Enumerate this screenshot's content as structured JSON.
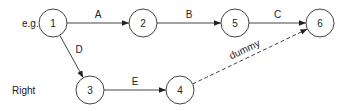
{
  "diagram": {
    "type": "activity-network",
    "row_labels": [
      {
        "id": "eg",
        "text": "e.g.",
        "x": 22,
        "y": 27
      },
      {
        "id": "right",
        "text": "Right",
        "x": 12,
        "y": 94
      }
    ],
    "nodes": [
      {
        "id": "1",
        "label": "1",
        "cx": 53,
        "cy": 23,
        "r": 14
      },
      {
        "id": "2",
        "label": "2",
        "cx": 143,
        "cy": 23,
        "r": 14
      },
      {
        "id": "5",
        "label": "5",
        "cx": 235,
        "cy": 23,
        "r": 14
      },
      {
        "id": "6",
        "label": "6",
        "cx": 320,
        "cy": 23,
        "r": 14
      },
      {
        "id": "3",
        "label": "3",
        "cx": 90,
        "cy": 90,
        "r": 14
      },
      {
        "id": "4",
        "label": "4",
        "cx": 180,
        "cy": 90,
        "r": 14
      }
    ],
    "edges": [
      {
        "id": "A",
        "label": "A",
        "from": "1",
        "to": "2",
        "dashed": false
      },
      {
        "id": "B",
        "label": "B",
        "from": "2",
        "to": "5",
        "dashed": false
      },
      {
        "id": "C",
        "label": "C",
        "from": "5",
        "to": "6",
        "dashed": false
      },
      {
        "id": "D",
        "label": "D",
        "from": "1",
        "to": "3",
        "dashed": false
      },
      {
        "id": "E",
        "label": "E",
        "from": "3",
        "to": "4",
        "dashed": false
      },
      {
        "id": "dummy",
        "label": "dummy",
        "from": "4",
        "to": "6",
        "dashed": true
      }
    ]
  }
}
